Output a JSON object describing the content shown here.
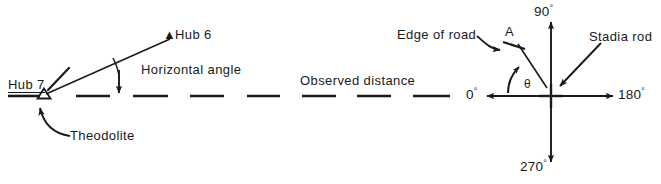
{
  "figure": {
    "background_color": "#ffffff",
    "ink_color": "#1a1a1a",
    "width": 661,
    "height": 184
  },
  "left_panel": {
    "name": "theodolite-horizontal-angle-diagram",
    "hub7": {
      "label": "Hub 7",
      "marker": "open-triangle-glyph",
      "marker_glyph": "△"
    },
    "hub6": {
      "label": "Hub 6",
      "marker": "filled-triangle-glyph",
      "marker_glyph": "▲"
    },
    "angle_label": "Horizontal angle",
    "instrument_label": "Theodolite",
    "distance_label": "Observed distance"
  },
  "right_panel": {
    "name": "compass-rose-stadia-diagram",
    "bearings": {
      "east": "0",
      "north": "90",
      "west": "180",
      "south": "270",
      "degree_symbol": "°"
    },
    "point_label": "A",
    "angle_symbol": "θ",
    "edge_of_road_label": "Edge of road",
    "stadia_rod_label": "Stadia rod",
    "center_marker": "cross-marker"
  }
}
